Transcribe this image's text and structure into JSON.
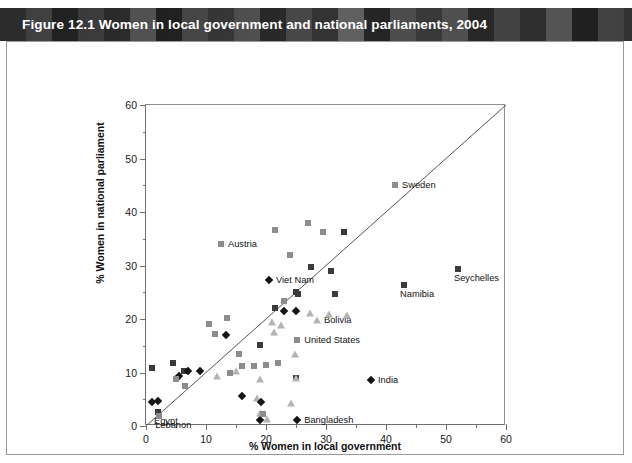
{
  "banner": {
    "title": "Figure 12.1 Women in local government and national parliaments, 2004"
  },
  "legend": [
    {
      "label": "Africa",
      "marker": "square",
      "color": "#3b3b3b"
    },
    {
      "label": "Latin America and the Caribbean",
      "marker": "triangle",
      "color": "#b4b4b4"
    },
    {
      "label": "Asia",
      "marker": "diamond",
      "color": "#151515"
    },
    {
      "label": "Developed Regions",
      "marker": "square",
      "color": "#8c8c8c"
    }
  ],
  "chart_data": {
    "type": "scatter",
    "title": "Figure 12.1 Women in local government and national parliaments, 2004",
    "xlabel": "% Women in local government",
    "ylabel": "% Women in national parliament",
    "xlim": [
      0,
      60
    ],
    "ylim": [
      0,
      60
    ],
    "xticks": [
      0,
      10,
      20,
      30,
      40,
      50,
      60
    ],
    "yticks": [
      0,
      10,
      20,
      30,
      40,
      50,
      60
    ],
    "xminor": [
      5,
      15,
      25,
      35,
      45,
      55
    ],
    "yminor": [
      5,
      15,
      25,
      35,
      45,
      55
    ],
    "grid": false,
    "legend_position": "bottom",
    "reference_line": {
      "label": "45-degree parity line",
      "from": [
        0,
        0
      ],
      "to": [
        60,
        60
      ]
    },
    "series": [
      {
        "name": "Africa",
        "marker": "square",
        "color": "#3b3b3b",
        "points": [
          {
            "x": 1.0,
            "y": 10.8
          },
          {
            "x": 4.5,
            "y": 11.8
          },
          {
            "x": 6.3,
            "y": 10.3
          },
          {
            "x": 2.0,
            "y": 2.6,
            "label": "Egypt"
          },
          {
            "x": 19.0,
            "y": 15.2
          },
          {
            "x": 21.5,
            "y": 22.0
          },
          {
            "x": 25.0,
            "y": 25.0
          },
          {
            "x": 25.4,
            "y": 24.6
          },
          {
            "x": 27.5,
            "y": 29.8
          },
          {
            "x": 30.8,
            "y": 29.0
          },
          {
            "x": 31.5,
            "y": 24.6
          },
          {
            "x": 33.0,
            "y": 36.2
          },
          {
            "x": 25.0,
            "y": 8.9
          },
          {
            "x": 43.0,
            "y": 26.4,
            "label": "Namibia"
          },
          {
            "x": 52.0,
            "y": 29.4,
            "label": "Seychelles"
          }
        ]
      },
      {
        "name": "Latin America and the Caribbean",
        "marker": "triangle",
        "color": "#b4b4b4",
        "points": [
          {
            "x": 11.8,
            "y": 9.3
          },
          {
            "x": 15.0,
            "y": 10.2
          },
          {
            "x": 18.5,
            "y": 5.2
          },
          {
            "x": 19.0,
            "y": 2.4
          },
          {
            "x": 19.0,
            "y": 8.8
          },
          {
            "x": 20.2,
            "y": 1.4
          },
          {
            "x": 21.0,
            "y": 19.5
          },
          {
            "x": 21.4,
            "y": 17.5
          },
          {
            "x": 22.5,
            "y": 18.8
          },
          {
            "x": 24.2,
            "y": 4.3
          },
          {
            "x": 24.8,
            "y": 13.5
          },
          {
            "x": 25.0,
            "y": 9.0
          },
          {
            "x": 27.4,
            "y": 21.2
          },
          {
            "x": 28.5,
            "y": 19.8,
            "label": "Bolivia"
          },
          {
            "x": 30.5,
            "y": 21.0
          },
          {
            "x": 33.5,
            "y": 20.8
          }
        ]
      },
      {
        "name": "Asia",
        "marker": "diamond",
        "color": "#151515",
        "points": [
          {
            "x": 1.0,
            "y": 4.4
          },
          {
            "x": 2.0,
            "y": 4.6
          },
          {
            "x": 5.5,
            "y": 9.3
          },
          {
            "x": 7.0,
            "y": 10.2
          },
          {
            "x": 9.0,
            "y": 10.3
          },
          {
            "x": 13.3,
            "y": 17.1
          },
          {
            "x": 16.0,
            "y": 5.6
          },
          {
            "x": 19.0,
            "y": 1.2
          },
          {
            "x": 19.2,
            "y": 4.5
          },
          {
            "x": 20.5,
            "y": 27.3,
            "label": "Viet Nam"
          },
          {
            "x": 23.0,
            "y": 21.5
          },
          {
            "x": 25.0,
            "y": 21.5
          },
          {
            "x": 25.2,
            "y": 1.2,
            "label": "Bangladesh"
          },
          {
            "x": 37.5,
            "y": 8.6,
            "label": "India"
          }
        ]
      },
      {
        "name": "Developed Regions",
        "marker": "square",
        "color": "#8c8c8c",
        "points": [
          {
            "x": 2.2,
            "y": 1.8,
            "label": "Lebanon"
          },
          {
            "x": 5.0,
            "y": 8.8
          },
          {
            "x": 6.5,
            "y": 7.5
          },
          {
            "x": 10.5,
            "y": 19.0
          },
          {
            "x": 11.5,
            "y": 17.2
          },
          {
            "x": 12.5,
            "y": 34.0,
            "label": "Austria"
          },
          {
            "x": 13.5,
            "y": 20.2
          },
          {
            "x": 14.0,
            "y": 10.0
          },
          {
            "x": 15.5,
            "y": 13.5
          },
          {
            "x": 16.0,
            "y": 11.2
          },
          {
            "x": 18.0,
            "y": 11.2
          },
          {
            "x": 19.5,
            "y": 2.2
          },
          {
            "x": 20.0,
            "y": 11.4
          },
          {
            "x": 21.5,
            "y": 36.6
          },
          {
            "x": 22.0,
            "y": 11.8
          },
          {
            "x": 23.0,
            "y": 23.3
          },
          {
            "x": 24.0,
            "y": 32.0
          },
          {
            "x": 25.2,
            "y": 16.0,
            "label": "United States"
          },
          {
            "x": 27.0,
            "y": 38.0
          },
          {
            "x": 29.5,
            "y": 36.3
          },
          {
            "x": 41.5,
            "y": 45.0,
            "label": "Sweden"
          }
        ]
      }
    ]
  }
}
